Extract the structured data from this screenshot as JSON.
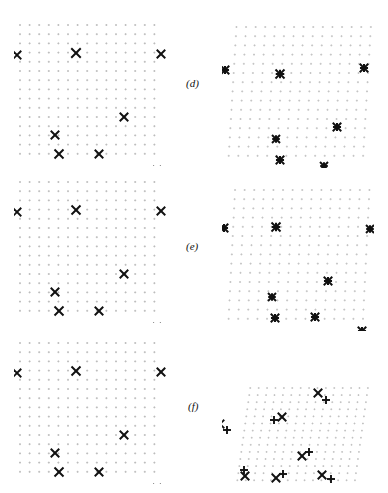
{
  "figure": {
    "domain": "scientific-figure",
    "width": 388,
    "height": 493,
    "background_color": "#ffffff",
    "ink_color": "#111111",
    "grid_dot_color": "#b9b9b9",
    "rows": [
      {
        "id": "row-d",
        "label": "(d)",
        "label_x": 186,
        "label_y": 77,
        "top": 0,
        "left_panel": {
          "id": "panel-d-left",
          "x": 14,
          "y": 18,
          "width": 152,
          "height": 148,
          "grid": {
            "cols": 15,
            "rows": 15,
            "spacing_x": 9.6,
            "spacing_y": 9.2,
            "origin_x": 6,
            "origin_y": 7,
            "shear_x": 0,
            "shear_y": 0,
            "marker": "plus",
            "marker_size": 2.0,
            "color": "#b9b9b9"
          },
          "points": [
            {
              "x": 3,
              "y": 37,
              "marker": "x",
              "size": 8.5
            },
            {
              "x": 62,
              "y": 35,
              "marker": "x",
              "size": 9.5
            },
            {
              "x": 147,
              "y": 36,
              "marker": "x",
              "size": 8.5
            },
            {
              "x": 110,
              "y": 99,
              "marker": "x",
              "size": 8.5
            },
            {
              "x": 41,
              "y": 117,
              "marker": "x",
              "size": 8.5
            },
            {
              "x": 45,
              "y": 136,
              "marker": "x",
              "size": 9.0
            },
            {
              "x": 85,
              "y": 136,
              "marker": "x",
              "size": 8.5
            },
            {
              "x": 143,
              "y": 152,
              "marker": "x",
              "size": 8.0
            }
          ]
        },
        "right_panel": {
          "id": "panel-d-right",
          "x": 222,
          "y": 20,
          "width": 152,
          "height": 148,
          "grid": {
            "cols": 15,
            "rows": 15,
            "spacing_x": 9.6,
            "spacing_y": 9.2,
            "origin_x": 6,
            "origin_y": 7,
            "shear_x": 0.06,
            "shear_y": 0.0,
            "marker": "plus",
            "marker_size": 2.0,
            "color": "#c2c2c2"
          },
          "points": [
            {
              "x": 3,
              "y": 50,
              "marker": "star",
              "size": 8.5
            },
            {
              "x": 58,
              "y": 54,
              "marker": "star",
              "size": 9.0
            },
            {
              "x": 142,
              "y": 48,
              "marker": "star",
              "size": 8.5
            },
            {
              "x": 115,
              "y": 107,
              "marker": "star",
              "size": 8.5
            },
            {
              "x": 54,
              "y": 119,
              "marker": "star",
              "size": 8.0
            },
            {
              "x": 58,
              "y": 140,
              "marker": "star",
              "size": 8.5
            },
            {
              "x": 102,
              "y": 146,
              "marker": "star",
              "size": 8.0
            },
            {
              "x": 141,
              "y": 155,
              "marker": "star",
              "size": 8.5
            }
          ]
        }
      },
      {
        "id": "row-e",
        "label": "(e)",
        "label_x": 186,
        "label_y": 240,
        "top": 163,
        "left_panel": {
          "id": "panel-e-left",
          "x": 14,
          "y": 175,
          "width": 152,
          "height": 148,
          "grid": {
            "cols": 15,
            "rows": 15,
            "spacing_x": 9.6,
            "spacing_y": 9.2,
            "origin_x": 6,
            "origin_y": 7,
            "shear_x": 0,
            "shear_y": 0,
            "marker": "plus",
            "marker_size": 2.0,
            "color": "#b9b9b9"
          },
          "points": [
            {
              "x": 3,
              "y": 37,
              "marker": "x",
              "size": 8.5
            },
            {
              "x": 62,
              "y": 35,
              "marker": "x",
              "size": 9.0
            },
            {
              "x": 147,
              "y": 36,
              "marker": "x",
              "size": 8.5
            },
            {
              "x": 110,
              "y": 99,
              "marker": "x",
              "size": 8.5
            },
            {
              "x": 41,
              "y": 117,
              "marker": "x",
              "size": 8.5
            },
            {
              "x": 45,
              "y": 136,
              "marker": "x",
              "size": 9.0
            },
            {
              "x": 85,
              "y": 136,
              "marker": "x",
              "size": 8.5
            },
            {
              "x": 143,
              "y": 152,
              "marker": "x",
              "size": 8.0
            }
          ]
        },
        "right_panel": {
          "id": "panel-e-right",
          "x": 222,
          "y": 183,
          "width": 152,
          "height": 148,
          "grid": {
            "cols": 15,
            "rows": 15,
            "spacing_x": 9.6,
            "spacing_y": 9.2,
            "origin_x": 6,
            "origin_y": 7,
            "shear_x": 0.05,
            "shear_y": 0.0,
            "marker": "plus",
            "marker_size": 2.0,
            "color": "#c2c2c2"
          },
          "points": [
            {
              "x": 2,
              "y": 45,
              "marker": "star",
              "size": 8.5
            },
            {
              "x": 54,
              "y": 44,
              "marker": "star",
              "size": 9.0
            },
            {
              "x": 148,
              "y": 46,
              "marker": "star",
              "size": 8.0
            },
            {
              "x": 106,
              "y": 98,
              "marker": "star",
              "size": 8.5
            },
            {
              "x": 50,
              "y": 114,
              "marker": "star",
              "size": 8.0
            },
            {
              "x": 53,
              "y": 135,
              "marker": "star",
              "size": 8.5
            },
            {
              "x": 93,
              "y": 134,
              "marker": "star",
              "size": 8.5
            },
            {
              "x": 140,
              "y": 148,
              "marker": "star",
              "size": 8.5
            }
          ]
        }
      },
      {
        "id": "row-f",
        "label": "(f)",
        "label_x": 188,
        "label_y": 400,
        "top": 326,
        "left_panel": {
          "id": "panel-f-left",
          "x": 14,
          "y": 336,
          "width": 152,
          "height": 148,
          "grid": {
            "cols": 15,
            "rows": 15,
            "spacing_x": 9.6,
            "spacing_y": 9.2,
            "origin_x": 6,
            "origin_y": 7,
            "shear_x": 0,
            "shear_y": 0,
            "marker": "plus",
            "marker_size": 2.0,
            "color": "#b9b9b9"
          },
          "points": [
            {
              "x": 3,
              "y": 37,
              "marker": "x",
              "size": 8.5
            },
            {
              "x": 62,
              "y": 35,
              "marker": "x",
              "size": 9.0
            },
            {
              "x": 147,
              "y": 36,
              "marker": "x",
              "size": 8.5
            },
            {
              "x": 110,
              "y": 99,
              "marker": "x",
              "size": 8.5
            },
            {
              "x": 41,
              "y": 117,
              "marker": "x",
              "size": 8.5
            },
            {
              "x": 45,
              "y": 136,
              "marker": "x",
              "size": 9.0
            },
            {
              "x": 85,
              "y": 136,
              "marker": "x",
              "size": 8.5
            },
            {
              "x": 143,
              "y": 152,
              "marker": "x",
              "size": 8.0
            }
          ]
        },
        "right_panel": {
          "id": "panel-f-right",
          "x": 222,
          "y": 378,
          "width": 152,
          "height": 112,
          "grid": {
            "cols": 15,
            "rows": 14,
            "spacing_x": 8.4,
            "spacing_y": 7.1,
            "origin_x": 14,
            "origin_y": 10,
            "shear_x": 0.14,
            "shear_y": 0.0,
            "marker": "plus",
            "marker_size": 1.8,
            "color": "#c0c0c0"
          },
          "points": [
            {
              "x": 96,
              "y": 15,
              "marker": "x",
              "size": 8.5
            },
            {
              "x": 104,
              "y": 22,
              "marker": "plus",
              "size": 8.0
            },
            {
              "x": 60,
              "y": 39,
              "marker": "x",
              "size": 8.5
            },
            {
              "x": 52,
              "y": 42,
              "marker": "plus",
              "size": 8.0
            },
            {
              "x": -2,
              "y": 46,
              "marker": "x",
              "size": 8.5
            },
            {
              "x": 5,
              "y": 52,
              "marker": "plus",
              "size": 8.0
            },
            {
              "x": 80,
              "y": 78,
              "marker": "x",
              "size": 8.5
            },
            {
              "x": 87,
              "y": 74,
              "marker": "plus",
              "size": 8.0
            },
            {
              "x": 23,
              "y": 98,
              "marker": "x",
              "size": 8.5
            },
            {
              "x": 22,
              "y": 92,
              "marker": "plus",
              "size": 8.0
            },
            {
              "x": 54,
              "y": 100,
              "marker": "x",
              "size": 8.5
            },
            {
              "x": 61,
              "y": 96,
              "marker": "plus",
              "size": 8.0
            },
            {
              "x": 100,
              "y": 97,
              "marker": "x",
              "size": 8.5
            },
            {
              "x": 109,
              "y": 101,
              "marker": "plus",
              "size": 8.0
            }
          ]
        }
      }
    ]
  }
}
